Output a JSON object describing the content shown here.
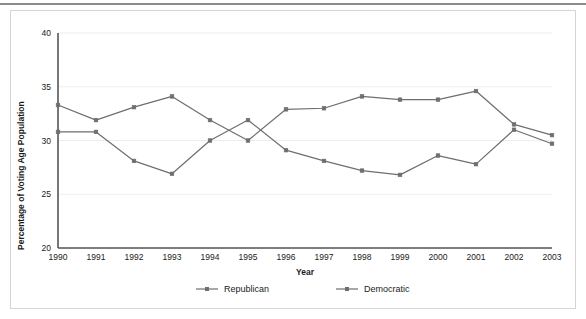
{
  "chart_data": {
    "type": "line",
    "title": "",
    "xlabel": "Year",
    "ylabel": "Percentage of Voting Age Population",
    "categories": [
      "1990",
      "1991",
      "1992",
      "1993",
      "1994",
      "1995",
      "1996",
      "1997",
      "1998",
      "1999",
      "2000",
      "2001",
      "2002",
      "2003"
    ],
    "x": [
      1990,
      1991,
      1992,
      1993,
      1994,
      1995,
      1996,
      1997,
      1998,
      1999,
      2000,
      2001,
      2002,
      2003
    ],
    "xlim": [
      1990,
      2003
    ],
    "ylim": [
      20,
      40
    ],
    "yticks": [
      20,
      25,
      30,
      35,
      40
    ],
    "ytick_labels": [
      "20",
      "25",
      "30",
      "35",
      "40"
    ],
    "grid": "horizontal",
    "legend_position": "bottom",
    "series": [
      {
        "name": "Republican",
        "color": "#6e6e6e",
        "values": [
          30.8,
          30.8,
          28.1,
          26.9,
          30.0,
          31.9,
          29.1,
          28.1,
          27.2,
          26.8,
          28.6,
          27.8,
          31.0,
          29.7
        ]
      },
      {
        "name": "Democratic",
        "color": "#6e6e6e",
        "values": [
          33.3,
          31.9,
          33.1,
          34.1,
          31.9,
          30.0,
          32.9,
          33.0,
          34.1,
          33.8,
          33.8,
          34.6,
          31.5,
          30.5
        ]
      }
    ]
  },
  "legend": {
    "items": [
      {
        "label": "Republican"
      },
      {
        "label": "Democratic"
      }
    ]
  },
  "axes": {
    "x_title": "Year",
    "y_title": "Percentage of Voting Age Population"
  }
}
